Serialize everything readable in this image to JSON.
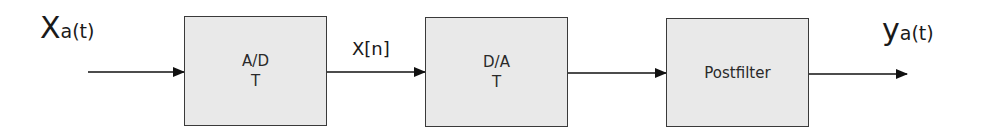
{
  "input_signal": {
    "main": "X",
    "sub": "a(t)"
  },
  "output_signal": {
    "main": "y",
    "sub": "a(t)"
  },
  "intermediate_signal": "X[n]",
  "blocks": [
    {
      "line1": "A/D",
      "line2": "T"
    },
    {
      "line1": "D/A",
      "line2": "T"
    },
    {
      "line1": "Postfilter",
      "line2": ""
    }
  ],
  "colors": {
    "block_fill": "#e9e9e9",
    "block_border": "#3a3a3a",
    "arrow": "#111111"
  }
}
